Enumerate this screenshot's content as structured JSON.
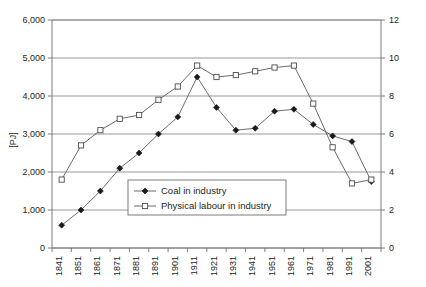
{
  "chart_data": {
    "type": "line",
    "title": "",
    "xlabel": "",
    "ylabel": "[PJ]",
    "y2label": "",
    "categories": [
      "1841",
      "1851",
      "1861",
      "1871",
      "1881",
      "1891",
      "1901",
      "1911",
      "1921",
      "1931",
      "1941",
      "1951",
      "1961",
      "1971",
      "1981",
      "1991",
      "2001"
    ],
    "ylim": [
      0,
      6000
    ],
    "yticks": [
      "0",
      "1,000",
      "2,000",
      "3,000",
      "4,000",
      "5,000",
      "6,000"
    ],
    "ytick_values": [
      0,
      1000,
      2000,
      3000,
      4000,
      5000,
      6000
    ],
    "y2lim": [
      0,
      12
    ],
    "y2ticks": [
      "0",
      "2",
      "4",
      "6",
      "8",
      "10",
      "12"
    ],
    "y2tick_values": [
      0,
      2,
      4,
      6,
      8,
      10,
      12
    ],
    "grid": true,
    "legend_position": "inside-bottom-left",
    "series": [
      {
        "name": "Coal in industry",
        "marker": "filled-diamond",
        "axis": "left",
        "values": [
          600,
          1000,
          1500,
          2100,
          2500,
          3000,
          3450,
          4500,
          3700,
          3100,
          3150,
          3600,
          3650,
          3250,
          2950,
          2800,
          1750
        ]
      },
      {
        "name": "Physical labour in industry",
        "marker": "open-square",
        "axis": "left",
        "values": [
          1800,
          2700,
          3100,
          3400,
          3500,
          3900,
          4250,
          4800,
          4500,
          4550,
          4650,
          4750,
          4800,
          3800,
          2650,
          1700,
          1800
        ]
      }
    ]
  },
  "legend": {
    "items": [
      {
        "label": "Coal in industry",
        "marker": "filled-diamond"
      },
      {
        "label": "Physical labour in industry",
        "marker": "open-square"
      }
    ]
  },
  "colors": {
    "line": "#5a5a5a",
    "grid": "#7f7f7f",
    "frame": "#6e6e6e",
    "text": "#231f20",
    "marker_fill": "#1a1a1a",
    "background": "#ffffff"
  }
}
